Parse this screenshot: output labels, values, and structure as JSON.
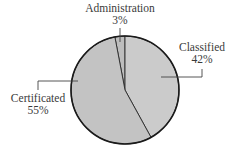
{
  "chart_data": {
    "type": "pie",
    "title": "",
    "categories": [
      "Administration",
      "Classified",
      "Certificated"
    ],
    "values": [
      3,
      42,
      55
    ],
    "unit": "%",
    "labels": [
      {
        "name": "Administration",
        "pct": "3%"
      },
      {
        "name": "Classified",
        "pct": "42%"
      },
      {
        "name": "Certificated",
        "pct": "55%"
      }
    ],
    "legend": "none (callout labels with leader lines)"
  },
  "colors": {
    "administration": "#bdbdbd",
    "classified": "#cbcbcb",
    "certificated": "#c3c3c3",
    "outline": "#1a1a1a",
    "text": "#3a3a3a"
  }
}
